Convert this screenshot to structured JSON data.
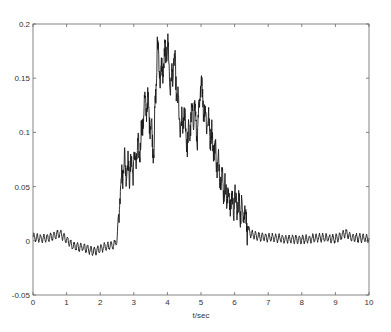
{
  "chart_data": {
    "type": "line",
    "title": "",
    "xlabel": "t/sec",
    "ylabel": "",
    "xlim": [
      0,
      10
    ],
    "ylim": [
      -0.05,
      0.2
    ],
    "grid": false,
    "legend": null,
    "x_ticks": [
      0,
      1,
      2,
      3,
      4,
      5,
      6,
      7,
      8,
      9,
      10
    ],
    "x_tick_labels": [
      "0",
      "1",
      "2",
      "3",
      "4",
      "5",
      "6",
      "7",
      "8",
      "9",
      "10"
    ],
    "y_ticks": [
      -0.05,
      0,
      0.05,
      0.1,
      0.15,
      0.2
    ],
    "y_tick_labels": [
      "-0.05",
      "0",
      "0.05",
      "0.1",
      "0.15",
      "0.2"
    ],
    "series": [
      {
        "name": "signal",
        "color": "#1a1a1a",
        "envelope": {
          "x": [
            0,
            0.3,
            0.6,
            0.8,
            0.9,
            1.2,
            1.5,
            1.8,
            2.1,
            2.4,
            2.5,
            2.6,
            2.7,
            2.85,
            3.0,
            3.1,
            3.2,
            3.3,
            3.4,
            3.5,
            3.6,
            3.7,
            3.8,
            3.9,
            4.0,
            4.1,
            4.2,
            4.3,
            4.4,
            4.5,
            4.6,
            4.7,
            4.8,
            4.9,
            5.0,
            5.1,
            5.2,
            5.3,
            5.4,
            5.5,
            5.6,
            5.7,
            5.8,
            5.9,
            6.0,
            6.1,
            6.2,
            6.3,
            6.4,
            6.5,
            6.7,
            7.0,
            7.5,
            8.0,
            8.5,
            9.0,
            9.3,
            9.5,
            10.0
          ],
          "y": [
            0.003,
            0.002,
            0.004,
            0.007,
            0.004,
            -0.005,
            -0.006,
            -0.01,
            -0.006,
            -0.004,
            0.0,
            0.05,
            0.072,
            0.065,
            0.07,
            0.08,
            0.088,
            0.122,
            0.128,
            0.108,
            0.085,
            0.18,
            0.15,
            0.165,
            0.182,
            0.14,
            0.168,
            0.13,
            0.1,
            0.118,
            0.088,
            0.11,
            0.122,
            0.095,
            0.15,
            0.118,
            0.11,
            0.098,
            0.085,
            0.07,
            0.06,
            0.048,
            0.04,
            0.035,
            0.037,
            0.032,
            0.03,
            0.028,
            0.01,
            0.006,
            0.004,
            0.003,
            0.002,
            0.001,
            0.003,
            0.002,
            0.007,
            0.003,
            0.002
          ]
        },
        "oscillation": {
          "period_sec": 0.1,
          "amplitude": 0.0035
        }
      }
    ]
  }
}
